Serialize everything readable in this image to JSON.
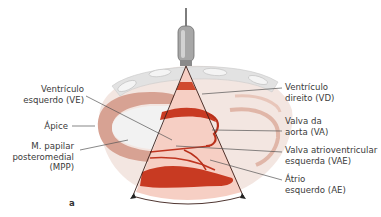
{
  "figure": {
    "panel_letter": "a",
    "colors": {
      "myocardium_dark": "#c83a22",
      "chamber_fill": "#f6cfc4",
      "outer_tissue": "#d9a898",
      "ribs": "#e4e4e4",
      "probe_body": "#9a9a9a",
      "leader_line": "#555555",
      "label_text": "#3a3a3a"
    },
    "labels_left": [
      {
        "id": "ve",
        "line1": "Ventrículo",
        "line2": "esquerdo (VE)"
      },
      {
        "id": "apice",
        "line1": "Ápice"
      },
      {
        "id": "mpp",
        "line1": "M. papilar",
        "line2": "posteromedial",
        "line3": "(MPP)"
      }
    ],
    "labels_right": [
      {
        "id": "vd",
        "line1": "Ventrículo",
        "line2": "direito (VD)"
      },
      {
        "id": "va",
        "line1": "Valva da",
        "line2": "aorta (VA)"
      },
      {
        "id": "vae",
        "line1": "Valva atrioventricular",
        "line2": "esquerda (VAE)"
      },
      {
        "id": "ae",
        "line1": "Átrio",
        "line2": "esquerdo (AE)"
      }
    ]
  }
}
